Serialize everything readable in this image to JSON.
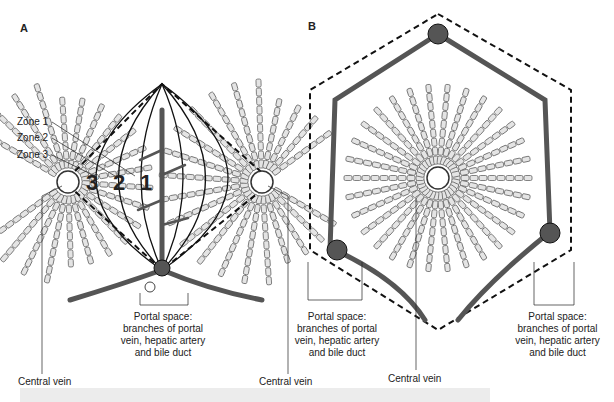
{
  "panels": {
    "a": {
      "letter": "A",
      "zones": [
        "Zone 1",
        "Zone 2",
        "Zone 3"
      ],
      "zone_numbers": [
        "3",
        "2",
        "1"
      ],
      "portal_label": [
        "Portal space:",
        "branches of portal",
        "vein, hepatic artery",
        "and bile duct"
      ],
      "central_vein_left": "Central vein",
      "central_vein_right": "Central vein"
    },
    "b": {
      "letter": "B",
      "portal_left": [
        "Portal space:",
        "branches of portal",
        "vein, hepatic artery",
        "and bile duct"
      ],
      "portal_right": [
        "Portal space:",
        "branches of portal",
        "vein, hepatic artery",
        "and bile duct"
      ],
      "central_vein": "Central vein"
    }
  },
  "colors": {
    "vessel": "#555555",
    "cell_fill": "#e4e4e4",
    "line": "#222222"
  }
}
